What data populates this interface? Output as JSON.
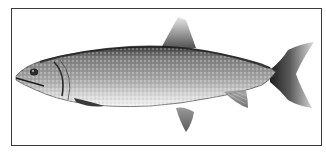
{
  "image": {
    "subject": "Lake trout illustration",
    "style": "monochrome engraving-style drawing",
    "frame_color": "#3a3a3a",
    "background": "#ffffff",
    "fish_colors": {
      "dark": "#2a2a2a",
      "mid": "#8a8a8a",
      "light": "#d8d8d8",
      "belly": "#f2f2f2"
    }
  }
}
